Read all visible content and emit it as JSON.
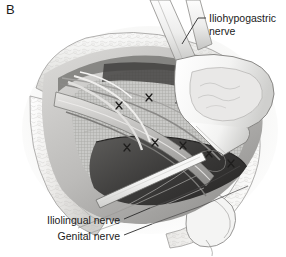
{
  "figure": {
    "panel_letter": "B",
    "palette": {
      "background": "#ffffff",
      "ink": "#1a1a1a",
      "outline": "#6b6b6b",
      "fat_tissue_light": "#f0efee",
      "fat_tissue_mid": "#dcdbd9",
      "muscle_mid": "#b9b8b6",
      "mesh_fill": "#c9c9c7",
      "mesh_dark_edge": "#4a4a4a",
      "shadow_dark": "#3a3a3a",
      "retractor_white": "#fbfbfb",
      "cord_gray": "#a8a7a5"
    }
  },
  "labels": [
    {
      "id": "iliohypogastric",
      "line1": "Iliohypogastric",
      "line2": "nerve",
      "text": "Iliohypogastric\nnerve",
      "position": "top-right",
      "leader": "hook-left-down"
    },
    {
      "id": "iliolingual",
      "text": "Iliolingual nerve",
      "position": "bottom-left",
      "leader": "dash-up-right"
    },
    {
      "id": "genital",
      "text": "Genital nerve",
      "position": "bottom-left",
      "leader": "dash-up-right"
    }
  ],
  "anatomy": {
    "wound_edge": "subcutaneous-fat-retracted",
    "mesh": "prosthetic-mesh-grid",
    "sutures": "interrupted-x-knots",
    "retractor": "army-navy-retractor-blade",
    "cord_structures": "spermatic-cord-and-nerves"
  }
}
